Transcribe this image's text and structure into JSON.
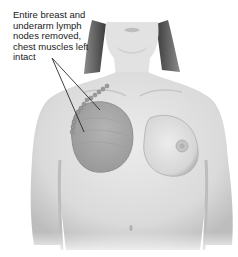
{
  "figure": {
    "callout": {
      "lines": [
        "Entire breast and",
        "underarm lymph",
        "nodes removed,",
        "chest muscles left",
        "intact"
      ]
    },
    "colors": {
      "background": "#ffffff",
      "skin_light": "#e6e6e6",
      "skin_mid": "#cfcfcf",
      "skin_shadow": "#a9a9a9",
      "removed_region": "#a8a8a8",
      "hair": "#5a5a5a",
      "leader_line": "#2a2a2a",
      "text": "#1a1a1a"
    }
  }
}
